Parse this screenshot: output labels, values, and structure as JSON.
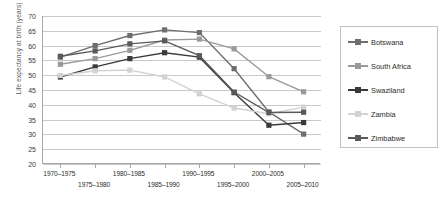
{
  "chart_data": {
    "type": "line",
    "title": "",
    "xlabel": "",
    "ylabel": "Life expectancy at birth (years)",
    "categories": [
      "1970–1975",
      "1975–1980",
      "1980–1985",
      "1985–1990",
      "1990–1995",
      "1995–2000",
      "2000–2005",
      "2005–2010"
    ],
    "ylim": [
      20,
      70
    ],
    "ytick_step": 5,
    "yticks": [
      20,
      25,
      30,
      35,
      40,
      45,
      50,
      55,
      60,
      65,
      70
    ],
    "grid": true,
    "legend_position": "right",
    "series": [
      {
        "name": "Botswana",
        "color": "#6e6e6e",
        "values": [
          56.1,
          60.0,
          63.4,
          65.3,
          64.4,
          52.2,
          37.6,
          30.1
        ]
      },
      {
        "name": "South Africa",
        "color": "#9a9a9a",
        "values": [
          53.7,
          55.6,
          58.4,
          61.9,
          62.2,
          58.9,
          49.5,
          44.4
        ]
      },
      {
        "name": "Swaziland",
        "color": "#3a3a3a",
        "values": [
          49.4,
          52.8,
          55.6,
          57.6,
          56.1,
          44.1,
          33.1,
          34.0
        ]
      },
      {
        "name": "Zambia",
        "color": "#d2d2d2",
        "values": [
          49.9,
          51.5,
          51.7,
          49.4,
          43.7,
          38.9,
          37.0,
          39.2
        ]
      },
      {
        "name": "Zimbabwe",
        "color": "#5a5a5a",
        "values": [
          56.4,
          58.2,
          60.6,
          61.6,
          56.6,
          44.3,
          37.4,
          37.5
        ]
      }
    ]
  },
  "legend": {
    "items": [
      {
        "label": "Botswana"
      },
      {
        "label": "South Africa"
      },
      {
        "label": "Swaziland"
      },
      {
        "label": "Zambia"
      },
      {
        "label": "Zimbabwe"
      }
    ]
  }
}
